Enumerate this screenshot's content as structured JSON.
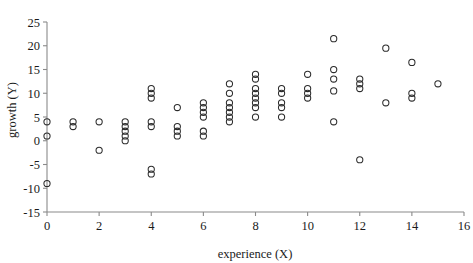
{
  "chart_data": {
    "type": "scatter",
    "title": "",
    "xlabel": "experience (X)",
    "ylabel": "growth (Y)",
    "xlim": [
      0,
      16
    ],
    "ylim": [
      -15,
      25
    ],
    "xticks": [
      0,
      2,
      4,
      6,
      8,
      10,
      12,
      14,
      16
    ],
    "xtick_labels": [
      "0",
      "2",
      "4",
      "6",
      "8",
      "10",
      "12",
      "14",
      "16"
    ],
    "yticks": [
      -15,
      -10,
      -5,
      0,
      5,
      10,
      15,
      20,
      25
    ],
    "ytick_labels": [
      "-15",
      "-10",
      "-5",
      "0",
      "5",
      "10",
      "15",
      "20",
      "25"
    ],
    "grid": false,
    "legend": null,
    "marker": "open-circle",
    "marker_color": "#2b2b2b",
    "points": [
      {
        "x": 0,
        "y": 4
      },
      {
        "x": 0,
        "y": 1
      },
      {
        "x": 0,
        "y": -9
      },
      {
        "x": 1,
        "y": 4
      },
      {
        "x": 1,
        "y": 3
      },
      {
        "x": 2,
        "y": 4
      },
      {
        "x": 2,
        "y": -2
      },
      {
        "x": 3,
        "y": 4
      },
      {
        "x": 3,
        "y": 3
      },
      {
        "x": 3,
        "y": 2
      },
      {
        "x": 3,
        "y": 1
      },
      {
        "x": 3,
        "y": 0
      },
      {
        "x": 4,
        "y": 11
      },
      {
        "x": 4,
        "y": 10
      },
      {
        "x": 4,
        "y": 9
      },
      {
        "x": 4,
        "y": 4
      },
      {
        "x": 4,
        "y": 3
      },
      {
        "x": 4,
        "y": -6
      },
      {
        "x": 4,
        "y": -7
      },
      {
        "x": 5,
        "y": 7
      },
      {
        "x": 5,
        "y": 3
      },
      {
        "x": 5,
        "y": 2
      },
      {
        "x": 5,
        "y": 1
      },
      {
        "x": 6,
        "y": 8
      },
      {
        "x": 6,
        "y": 7
      },
      {
        "x": 6,
        "y": 6
      },
      {
        "x": 6,
        "y": 5
      },
      {
        "x": 6,
        "y": 2
      },
      {
        "x": 6,
        "y": 1
      },
      {
        "x": 7,
        "y": 12
      },
      {
        "x": 7,
        "y": 10
      },
      {
        "x": 7,
        "y": 8
      },
      {
        "x": 7,
        "y": 7
      },
      {
        "x": 7,
        "y": 6
      },
      {
        "x": 7,
        "y": 5
      },
      {
        "x": 7,
        "y": 4
      },
      {
        "x": 8,
        "y": 14
      },
      {
        "x": 8,
        "y": 13
      },
      {
        "x": 8,
        "y": 11
      },
      {
        "x": 8,
        "y": 10
      },
      {
        "x": 8,
        "y": 9
      },
      {
        "x": 8,
        "y": 8
      },
      {
        "x": 8,
        "y": 7
      },
      {
        "x": 8,
        "y": 5
      },
      {
        "x": 9,
        "y": 11
      },
      {
        "x": 9,
        "y": 10
      },
      {
        "x": 9,
        "y": 8
      },
      {
        "x": 9,
        "y": 7
      },
      {
        "x": 9,
        "y": 5
      },
      {
        "x": 10,
        "y": 14
      },
      {
        "x": 10,
        "y": 11
      },
      {
        "x": 10,
        "y": 10
      },
      {
        "x": 10,
        "y": 9
      },
      {
        "x": 11,
        "y": 21.5
      },
      {
        "x": 11,
        "y": 15
      },
      {
        "x": 11,
        "y": 13
      },
      {
        "x": 11,
        "y": 10.5
      },
      {
        "x": 11,
        "y": 4
      },
      {
        "x": 12,
        "y": 13
      },
      {
        "x": 12,
        "y": 12
      },
      {
        "x": 12,
        "y": 11
      },
      {
        "x": 12,
        "y": -4
      },
      {
        "x": 13,
        "y": 19.5
      },
      {
        "x": 13,
        "y": 8
      },
      {
        "x": 14,
        "y": 16.5
      },
      {
        "x": 14,
        "y": 10
      },
      {
        "x": 14,
        "y": 9
      },
      {
        "x": 15,
        "y": 12
      }
    ]
  },
  "axes": {
    "x_title": "experience (X)",
    "y_title": "growth (Y)"
  }
}
